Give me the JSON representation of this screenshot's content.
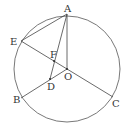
{
  "diagram": {
    "type": "geometry",
    "circle": {
      "center": "O",
      "cx": 67,
      "cy": 69,
      "r": 53
    },
    "points": {
      "A": {
        "label": "A",
        "x": 67,
        "y": 14
      },
      "E": {
        "label": "E",
        "x": 21,
        "y": 41
      },
      "F": {
        "label": "F",
        "x": 54,
        "y": 61
      },
      "O": {
        "label": "O",
        "x": 67,
        "y": 69
      },
      "D": {
        "label": "D",
        "x": 50,
        "y": 79
      },
      "B": {
        "label": "B",
        "x": 21,
        "y": 98
      },
      "C": {
        "label": "C",
        "x": 113,
        "y": 97
      }
    },
    "segments": [
      [
        "A",
        "E"
      ],
      [
        "A",
        "O"
      ],
      [
        "A",
        "D"
      ],
      [
        "E",
        "C"
      ],
      [
        "B",
        "O"
      ]
    ]
  }
}
